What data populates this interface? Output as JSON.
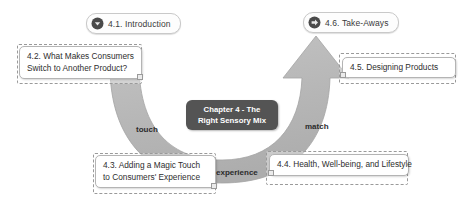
{
  "diagram": {
    "title": "Chapter 4 - The Right Sensory Mix",
    "center_box": {
      "line1": "Chapter 4 - The",
      "line2": "Right Sensory Mix"
    },
    "colors": {
      "arrow_fill": "#b9b9b9",
      "arrow_stroke": "#a3a3a3",
      "center_box_bg": "#545454",
      "center_box_text": "#ffffff",
      "card_bg": "#ffffff",
      "card_border": "#b4b4b4",
      "dashed_border": "#9a9a9a",
      "badge_icon_bg": "#4a4a4a",
      "text": "#2e2e2e"
    },
    "badges": [
      {
        "label": "4.1. Introduction",
        "icon": "circle-chevron-down-icon"
      },
      {
        "label": "4.6. Take-Aways",
        "icon": "circle-arrow-right-icon"
      }
    ],
    "nodes": [
      {
        "id": "4.2",
        "line1": "4.2. What Makes Consumers",
        "line2": "Switch to Another Product?"
      },
      {
        "id": "4.5",
        "line1": "4.5. Designing Products",
        "line2": ""
      },
      {
        "id": "4.3",
        "line1": "4.3. Adding a Magic Touch",
        "line2": "to Consumers' Experience"
      },
      {
        "id": "4.4",
        "line1": "4.4. Health, Well-being, and Lifestyle",
        "line2": ""
      }
    ],
    "stage_labels": {
      "touch": "touch",
      "experience": "experience",
      "match": "match"
    }
  }
}
